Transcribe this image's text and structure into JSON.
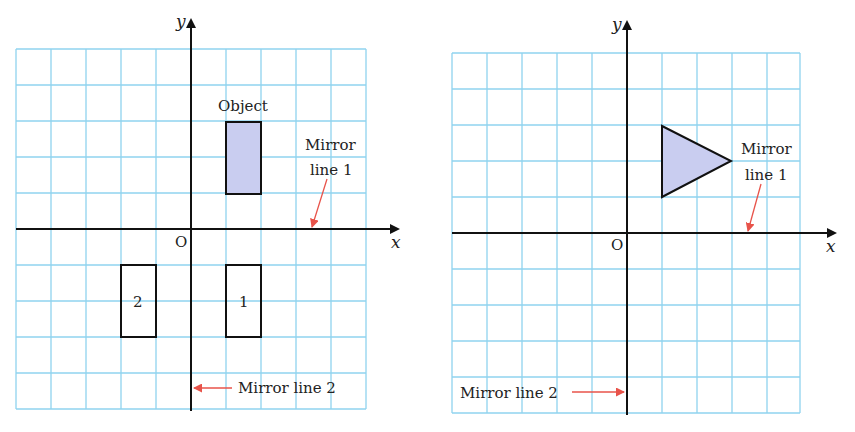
{
  "diagrams": [
    {
      "name": "rectangle-reflection",
      "origin_label": "O",
      "x_axis_label": "x",
      "y_axis_label": "y",
      "grid": {
        "cols_left": 5,
        "cols_right": 5,
        "rows_above": 5,
        "rows_below": 5
      },
      "object_label": "Object",
      "object_shape": "rectangle",
      "object_vertices": [
        [
          1,
          1
        ],
        [
          2,
          1
        ],
        [
          2,
          3
        ],
        [
          1,
          3
        ]
      ],
      "images": [
        {
          "label": "1",
          "vertices": [
            [
              1,
              -1
            ],
            [
              2,
              -1
            ],
            [
              2,
              -3
            ],
            [
              1,
              -3
            ]
          ]
        },
        {
          "label": "2",
          "vertices": [
            [
              -2,
              -1
            ],
            [
              -1,
              -1
            ],
            [
              -1,
              -3
            ],
            [
              -2,
              -3
            ]
          ]
        }
      ],
      "mirror_line_1_label_line1": "Mirror",
      "mirror_line_1_label_line2": "line 1",
      "mirror_line_2_label": "Mirror line 2"
    },
    {
      "name": "triangle-reflection",
      "origin_label": "O",
      "x_axis_label": "x",
      "y_axis_label": "y",
      "grid": {
        "cols_left": 5,
        "cols_right": 5,
        "rows_above": 5,
        "rows_below": 5
      },
      "object_shape": "triangle",
      "object_vertices": [
        [
          1,
          1
        ],
        [
          1,
          3
        ],
        [
          3,
          2
        ]
      ],
      "mirror_line_1_label_line1": "Mirror",
      "mirror_line_1_label_line2": "line 1",
      "mirror_line_2_label": "Mirror line 2"
    }
  ],
  "colors": {
    "grid": "#8fd3ef",
    "axis": "#111111",
    "shape_fill": "#c9cdf0",
    "shape_stroke": "#111111",
    "arrow": "#e8534a"
  }
}
